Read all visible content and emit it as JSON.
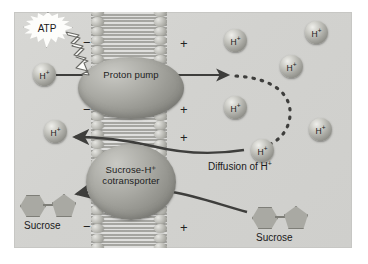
{
  "figure": {
    "background_color": "#ffffff",
    "panel_color": "#d4d4d1",
    "membrane_color": "#b9b9b4",
    "protein_color": "#a0a09a",
    "ion_color": "#b5b5af",
    "sucrose_color": "#a9a9a3",
    "arrow_color": "#3e3e3c",
    "atp_star_color": "#fdfdfb"
  },
  "proteins": [
    {
      "id": "proton-pump",
      "label_line1": "Proton pump",
      "label_line2": ""
    },
    {
      "id": "cotransporter",
      "label_line1": "Sucrose-H⁺",
      "label_line2": "cotransporter"
    }
  ],
  "energy": {
    "atp_label": "ATP",
    "bolt_name": "energy-bolt"
  },
  "ions": {
    "label": "H⁺",
    "symbol": "H",
    "charge": "+",
    "positions": [
      {
        "name": "h-ion-cytosol-1",
        "x": 33,
        "y": 63,
        "side": "cytosol"
      },
      {
        "name": "h-ion-cytosol-2",
        "x": 44,
        "y": 120,
        "side": "cytosol"
      },
      {
        "name": "h-ion-outside-1",
        "x": 224,
        "y": 29,
        "side": "outside"
      },
      {
        "name": "h-ion-outside-2",
        "x": 305,
        "y": 21,
        "side": "outside"
      },
      {
        "name": "h-ion-outside-3",
        "x": 280,
        "y": 55,
        "side": "outside"
      },
      {
        "name": "h-ion-outside-4",
        "x": 224,
        "y": 96,
        "side": "outside"
      },
      {
        "name": "h-ion-outside-5",
        "x": 309,
        "y": 118,
        "side": "outside"
      },
      {
        "name": "h-ion-outside-6",
        "x": 251,
        "y": 139,
        "side": "outside"
      }
    ]
  },
  "sucrose": [
    {
      "name": "sucrose-inside",
      "label": "Sucrose",
      "x": 20,
      "y": 192
    },
    {
      "name": "sucrose-outside",
      "label": "Sucrose",
      "x": 252,
      "y": 204
    }
  ],
  "labels": {
    "diffusion": "Diffusion of H⁺",
    "diffusion_text": "Diffusion of H",
    "diffusion_sup": "+"
  },
  "charges": {
    "negative": "−",
    "positive": "+",
    "negative_positions": [
      {
        "name": "charge-negative-top",
        "x": 83,
        "y": 36
      },
      {
        "name": "charge-negative-mid",
        "x": 83,
        "y": 103
      },
      {
        "name": "charge-negative-mid2",
        "x": 83,
        "y": 130
      },
      {
        "name": "charge-negative-bottom",
        "x": 83,
        "y": 220
      }
    ],
    "positive_positions": [
      {
        "name": "charge-positive-top",
        "x": 180,
        "y": 37
      },
      {
        "name": "charge-positive-mid",
        "x": 180,
        "y": 103
      },
      {
        "name": "charge-positive-mid2",
        "x": 180,
        "y": 131
      },
      {
        "name": "charge-positive-bottom",
        "x": 180,
        "y": 221
      }
    ]
  },
  "arrows": [
    {
      "name": "arrow-proton-pump-transport",
      "desc": "H+ pumped from cytosol through pump to outside"
    },
    {
      "name": "arrow-diffusion-dashed",
      "desc": "dashed arc of H+ diffusing back"
    },
    {
      "name": "arrow-h-into-cell",
      "desc": "H+ re-entering via cotransporter"
    },
    {
      "name": "arrow-sucrose-into-cell",
      "desc": "sucrose carried into cell"
    }
  ]
}
